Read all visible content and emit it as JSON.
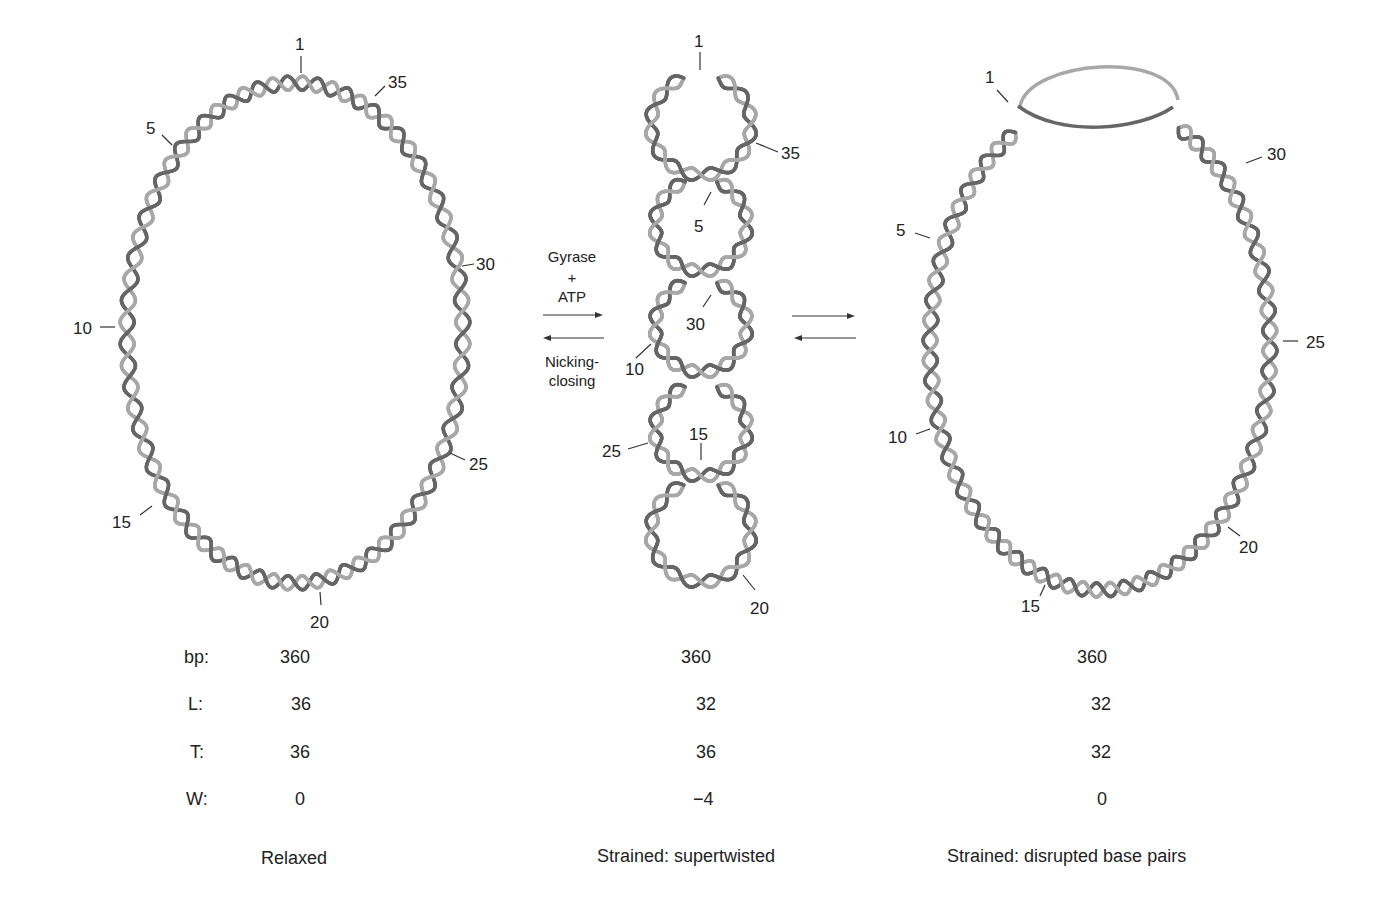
{
  "diagram": {
    "strand_colors": {
      "dark": "#666666",
      "light": "#a8a8a8"
    },
    "panels": [
      {
        "id": "relaxed",
        "caption": "Relaxed",
        "turn_labels": [
          {
            "text": "1"
          },
          {
            "text": "35"
          },
          {
            "text": "5"
          },
          {
            "text": "30"
          },
          {
            "text": "10"
          },
          {
            "text": "25"
          },
          {
            "text": "15"
          },
          {
            "text": "20"
          }
        ],
        "values": {
          "bp": "360",
          "L": "36",
          "T": "36",
          "W": "0"
        }
      },
      {
        "id": "supertwisted",
        "caption": "Strained: supertwisted",
        "turn_labels": [
          {
            "text": "1"
          },
          {
            "text": "35"
          },
          {
            "text": "5"
          },
          {
            "text": "30"
          },
          {
            "text": "10"
          },
          {
            "text": "25"
          },
          {
            "text": "15"
          },
          {
            "text": "20"
          }
        ],
        "values": {
          "bp": "360",
          "L": "32",
          "T": "36",
          "W": "−4"
        }
      },
      {
        "id": "disrupted",
        "caption": "Strained: disrupted base pairs",
        "turn_labels": [
          {
            "text": "1"
          },
          {
            "text": "30"
          },
          {
            "text": "5"
          },
          {
            "text": "25"
          },
          {
            "text": "10"
          },
          {
            "text": "20"
          },
          {
            "text": "15"
          }
        ],
        "values": {
          "bp": "360",
          "L": "32",
          "T": "32",
          "W": "0"
        }
      }
    ],
    "row_labels": {
      "bp": "bp:",
      "L": "L:",
      "T": "T:",
      "W": "W:"
    },
    "reaction_1": {
      "forward_label_line1": "Gyrase",
      "forward_label_line2": "+",
      "forward_label_line3": "ATP",
      "reverse_label_line1": "Nicking-",
      "reverse_label_line2": "closing"
    }
  }
}
